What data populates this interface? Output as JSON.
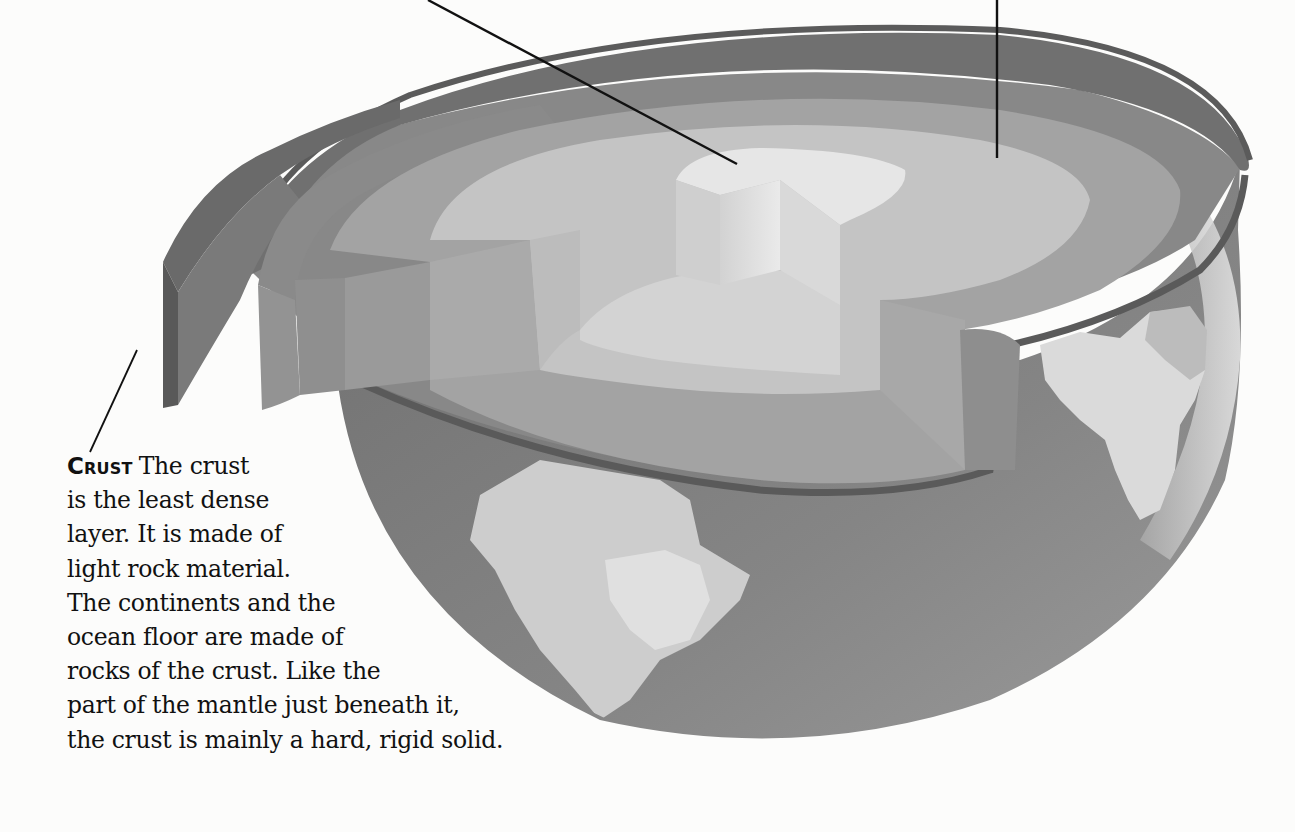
{
  "diagram": {
    "layers": [
      "crust",
      "mantle",
      "outer core",
      "inner core"
    ],
    "colors": {
      "background": "#fcfcfb",
      "crust_edge": "#5f5f5f",
      "crust": "#777777",
      "upper_mantle": "#8c8c8c",
      "lower_mantle": "#a6a6a6",
      "outer_core": "#c3c3c3",
      "inner_core": "#e3e3e3",
      "ocean": "#7d7d7d",
      "land": "#cfcfcf",
      "pointer_line": "#111111"
    },
    "pointers": [
      {
        "name": "inner-core-pointer",
        "target": "inner core"
      },
      {
        "name": "outer-core-pointer",
        "target": "outer core"
      },
      {
        "name": "crust-pointer",
        "target": "crust"
      }
    ]
  },
  "caption": {
    "lead": "Crust",
    "lines": [
      "The crust",
      "is the least dense",
      "layer. It is made of",
      "light rock material.",
      "The continents and the",
      "ocean floor are made of",
      "rocks of the crust. Like the",
      "part of the mantle just beneath it,",
      "the crust is mainly a hard, rigid solid."
    ]
  }
}
